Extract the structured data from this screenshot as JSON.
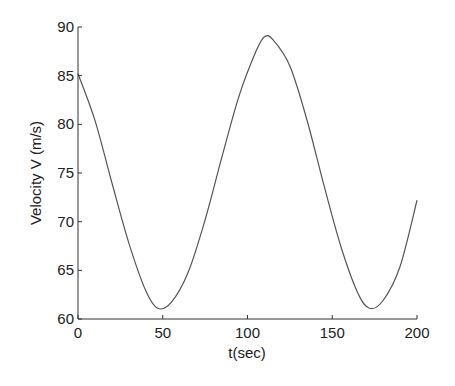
{
  "chart_data": {
    "type": "line",
    "title": "",
    "xlabel": "t(sec)",
    "ylabel": "Velocity V (m/s)",
    "xlim": [
      0,
      200
    ],
    "ylim": [
      60,
      90
    ],
    "xticks": [
      0,
      50,
      100,
      150,
      200
    ],
    "yticks": [
      60,
      65,
      70,
      75,
      80,
      85,
      90
    ],
    "grid": false,
    "legend": null,
    "series": [
      {
        "name": "V(t)",
        "color": "#555555",
        "x": [
          0,
          10,
          20,
          30,
          40,
          47,
          55,
          65,
          75,
          85,
          95,
          105,
          110,
          115,
          125,
          135,
          145,
          155,
          165,
          172,
          180,
          190,
          200
        ],
        "y": [
          85.2,
          80.4,
          74.0,
          67.8,
          62.9,
          61.1,
          61.7,
          64.8,
          70.2,
          76.7,
          82.9,
          87.5,
          89.0,
          88.7,
          86.0,
          80.5,
          73.8,
          67.5,
          62.7,
          61.1,
          61.9,
          65.4,
          72.2
        ]
      }
    ]
  }
}
